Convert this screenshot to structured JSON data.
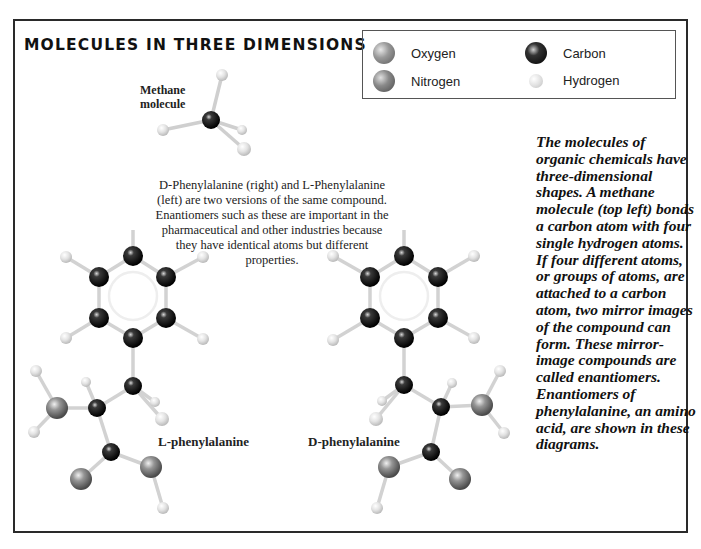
{
  "title": "MOLECULES IN THREE DIMENSIONS",
  "legend": {
    "items": [
      {
        "label": "Oxygen",
        "icon": "oxygen-atom-icon",
        "color": "#8a8a8a"
      },
      {
        "label": "Carbon",
        "icon": "carbon-atom-icon",
        "color": "#111111"
      },
      {
        "label": "Nitrogen",
        "icon": "nitrogen-atom-icon",
        "color": "#7a7a7a"
      },
      {
        "label": "Hydrogen",
        "icon": "hydrogen-atom-icon",
        "color": "#e0e0e0"
      }
    ]
  },
  "methane": {
    "label_line1": "Methane",
    "label_line2": "molecule"
  },
  "caption": "D-Phenylalanine (right) and L-Phenylalanine (left) are two versions of the same compound. Enantiomers such as these are important in the pharmaceutical and other industries because they have identical atoms but different properties.",
  "molecules": {
    "left_label": "L-phenylalanine",
    "right_label": "D-phenylalanine"
  },
  "side_text": "The molecules of organic chemicals have three-dimensional shapes. A methane molecule (top left) bonds a carbon atom with four single hydrogen atoms. If four different atoms, or groups of atoms, are attached to a carbon atom, two mirror images of the compound can form. These mirror-image compounds are called enantiomers. Enantiomers of phenylalanine, an amino acid, are shown in these diagrams.",
  "colors": {
    "carbon": "#111111",
    "oxygen": "#888888",
    "nitrogen": "#888888",
    "hydrogen": "#dcdcdc",
    "bond": "#d4d4d4",
    "border": "#2a2a2a"
  }
}
